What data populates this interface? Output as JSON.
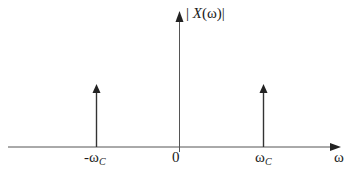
{
  "diagram": {
    "type": "frequency-spectrum",
    "y_axis_label": {
      "open": "| ",
      "var": "X",
      "arg": "(ω)",
      "close": "|"
    },
    "x_axis_label": "ω",
    "ticks": [
      {
        "main": "-ω",
        "sub": "C"
      },
      {
        "main": "0",
        "sub": ""
      },
      {
        "main": "ω",
        "sub": "C"
      }
    ],
    "impulses": [
      {
        "position": "-ωC",
        "height": "equal"
      },
      {
        "position": "ωC",
        "height": "equal"
      }
    ],
    "colors": {
      "stroke": "#333333",
      "text": "#1a1a1a",
      "background": "#ffffff"
    }
  }
}
